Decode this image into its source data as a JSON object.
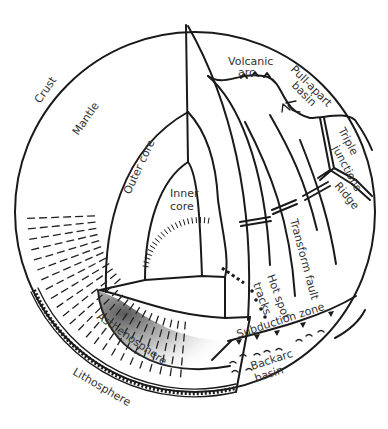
{
  "diagram": {
    "colors": {
      "ink": "#1a1a1a",
      "label": "#333333",
      "background": "#ffffff"
    },
    "layers": {
      "crust": "Crust",
      "mantle": "Mantle",
      "outer_core": "Outer core",
      "inner_core_line1": "Inner",
      "inner_core_line2": "core",
      "asthenosphere": "Asthenosphere",
      "lithosphere": "Lithosphere"
    },
    "features": {
      "volcanic_arc_line1": "Volcanic",
      "volcanic_arc_line2": "arc",
      "pull_apart_line1": "Pull-apart",
      "pull_apart_line2": "basin",
      "triple_line1": "Triple",
      "triple_line2": "junctions",
      "ridge": "Ridge",
      "transform_fault": "Transform fault",
      "hot_spot_line1": "Hot spot",
      "hot_spot_line2": "tracks",
      "subduction_zone": "Subduction zone",
      "backarc_line1": "Backarc",
      "backarc_line2": "basin"
    }
  }
}
